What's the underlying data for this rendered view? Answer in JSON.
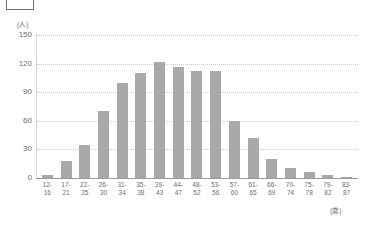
{
  "chart_data": {
    "type": "bar",
    "title": "",
    "subtitle": "",
    "xlabel": "(歳)",
    "ylabel": "(人)",
    "ylim": [
      0,
      150
    ],
    "yticks": [
      150,
      120,
      90,
      60,
      30,
      0
    ],
    "grid": true,
    "legend": null,
    "legend_position": "none",
    "bar_color": "#a9a9a9",
    "axis_color": "#9a9a9a",
    "grid_color": "#c9c9c9",
    "categories": [
      "12-16",
      "17-21",
      "22-25",
      "26-30",
      "31-34",
      "35-38",
      "39-43",
      "44-47",
      "48-52",
      "53-56",
      "57-60",
      "61-65",
      "66-69",
      "70-74",
      "75-78",
      "79-82",
      "83-87"
    ],
    "category_lines": [
      [
        "12-",
        "16"
      ],
      [
        "17-",
        "21"
      ],
      [
        "22-",
        "25"
      ],
      [
        "26-",
        "30"
      ],
      [
        "31-",
        "34"
      ],
      [
        "35-",
        "38"
      ],
      [
        "39-",
        "43"
      ],
      [
        "44-",
        "47"
      ],
      [
        "48-",
        "52"
      ],
      [
        "53-",
        "56"
      ],
      [
        "57-",
        "60"
      ],
      [
        "61-",
        "65"
      ],
      [
        "66-",
        "69"
      ],
      [
        "70-",
        "74"
      ],
      [
        "75-",
        "78"
      ],
      [
        "79-",
        "82"
      ],
      [
        "83-",
        "87"
      ]
    ],
    "values": [
      3,
      18,
      35,
      70,
      100,
      110,
      122,
      116,
      112,
      112,
      60,
      42,
      20,
      10,
      6,
      3,
      1
    ]
  },
  "overlay": {
    "top_box_label": ""
  }
}
